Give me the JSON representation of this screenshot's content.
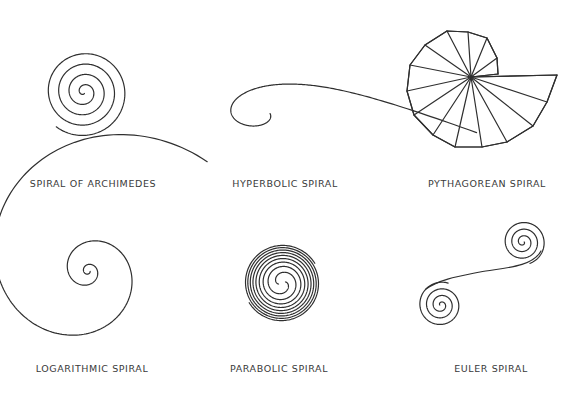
{
  "panels": [
    {
      "id": "archimedes",
      "label": "Spiral of Archimedes"
    },
    {
      "id": "hyperbolic",
      "label": "Hyperbolic Spiral"
    },
    {
      "id": "pythagorean",
      "label": "Pythagorean Spiral"
    },
    {
      "id": "logarithmic",
      "label": "Logarithmic Spiral"
    },
    {
      "id": "parabolic",
      "label": "Parabolic Spiral"
    },
    {
      "id": "euler",
      "label": "Euler Spiral"
    }
  ],
  "colors": {
    "stroke": "#2f2f2f",
    "text": "#3a3a3a",
    "background": "#ffffff"
  }
}
